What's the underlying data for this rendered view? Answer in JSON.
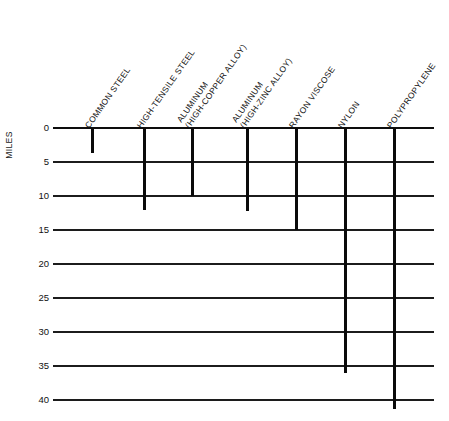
{
  "chart_data": {
    "type": "bar",
    "orientation": "vertical-downward",
    "title": "",
    "xlabel": "",
    "ylabel": "MILES",
    "ylim": [
      0,
      41.5
    ],
    "y_ticks": [
      0,
      5,
      10,
      15,
      20,
      25,
      30,
      35,
      40
    ],
    "grid": true,
    "legend": "none",
    "categories": [
      "COMMON STEEL",
      "HIGH-TENSILE STEEL",
      "ALUMINUM (HIGH-COPPER ALLOY)",
      "ALUMINUM (HIGH-ZINC ALLOY)",
      "RAYON VISCOSE",
      "NYLON",
      "POLYPROPYLENE"
    ],
    "values": [
      3.7,
      12.0,
      10.0,
      12.2,
      15.0,
      36.0,
      41.3
    ],
    "units": "miles"
  },
  "axis": {
    "title": "MILES",
    "ticks": [
      {
        "label": "0"
      },
      {
        "label": "5"
      },
      {
        "label": "10"
      },
      {
        "label": "15"
      },
      {
        "label": "20"
      },
      {
        "label": "25"
      },
      {
        "label": "30"
      },
      {
        "label": "35"
      },
      {
        "label": "40"
      }
    ]
  },
  "bars": [
    {
      "name": "common-steel",
      "line1": "COMMON STEEL",
      "line2": ""
    },
    {
      "name": "high-tensile-steel",
      "line1": "HIGH-TENSILE STEEL",
      "line2": ""
    },
    {
      "name": "aluminum-high-copper",
      "line1": "ALUMINUM",
      "line2": "(HIGH-COPPER ALLOY)"
    },
    {
      "name": "aluminum-high-zinc",
      "line1": "ALUMINUM",
      "line2": "(HIGH-ZINC ALLOY)"
    },
    {
      "name": "rayon-viscose",
      "line1": "RAYON VISCOSE",
      "line2": ""
    },
    {
      "name": "nylon",
      "line1": "NYLON",
      "line2": ""
    },
    {
      "name": "polypropylene",
      "line1": "POLYPROPYLENE",
      "line2": ""
    }
  ],
  "colors": {
    "bar": "#0a0a0a",
    "grid": "#1c1c1c",
    "text": "#111111",
    "background": "#ffffff"
  }
}
